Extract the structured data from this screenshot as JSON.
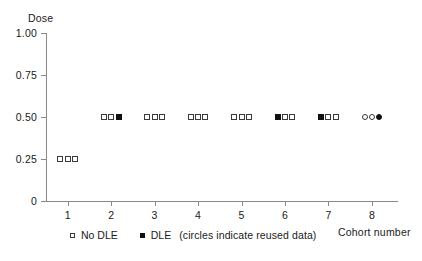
{
  "chart_data": {
    "type": "scatter",
    "title": "",
    "xlabel": "Cohort number",
    "ylabel": "Dose",
    "xlim": [
      0.5,
      8.6
    ],
    "ylim": [
      0,
      1.0
    ],
    "grid": false,
    "legend_position": "below-axes-left",
    "y_ticks": [
      "0",
      "0.25",
      "0.50",
      "0.75",
      "1.00"
    ],
    "y_tick_values": [
      0,
      0.25,
      0.5,
      0.75,
      1.0
    ],
    "x_ticks": [
      "1",
      "2",
      "3",
      "4",
      "5",
      "6",
      "7",
      "8"
    ],
    "x_tick_values": [
      1,
      2,
      3,
      4,
      5,
      6,
      7,
      8
    ],
    "marker_legend": [
      {
        "key": "square-open",
        "label": "No DLE"
      },
      {
        "key": "square-filled",
        "label": "DLE"
      }
    ],
    "legend_note": "(circles indicate reused data)",
    "series": [
      {
        "name": "No DLE",
        "marker": "square-open",
        "points": [
          {
            "x": 0.83,
            "y": 0.25,
            "cohort": 1
          },
          {
            "x": 1.0,
            "y": 0.25,
            "cohort": 1
          },
          {
            "x": 1.17,
            "y": 0.25,
            "cohort": 1
          },
          {
            "x": 1.83,
            "y": 0.5,
            "cohort": 2
          },
          {
            "x": 2.0,
            "y": 0.5,
            "cohort": 2
          },
          {
            "x": 2.83,
            "y": 0.5,
            "cohort": 3
          },
          {
            "x": 3.0,
            "y": 0.5,
            "cohort": 3
          },
          {
            "x": 3.17,
            "y": 0.5,
            "cohort": 3
          },
          {
            "x": 3.83,
            "y": 0.5,
            "cohort": 4
          },
          {
            "x": 4.0,
            "y": 0.5,
            "cohort": 4
          },
          {
            "x": 4.17,
            "y": 0.5,
            "cohort": 4
          },
          {
            "x": 4.83,
            "y": 0.5,
            "cohort": 5
          },
          {
            "x": 5.0,
            "y": 0.5,
            "cohort": 5
          },
          {
            "x": 5.17,
            "y": 0.5,
            "cohort": 5
          },
          {
            "x": 6.0,
            "y": 0.5,
            "cohort": 6
          },
          {
            "x": 6.17,
            "y": 0.5,
            "cohort": 6
          },
          {
            "x": 7.0,
            "y": 0.5,
            "cohort": 7
          },
          {
            "x": 7.17,
            "y": 0.5,
            "cohort": 7
          }
        ]
      },
      {
        "name": "DLE",
        "marker": "square-filled",
        "points": [
          {
            "x": 2.17,
            "y": 0.5,
            "cohort": 2
          },
          {
            "x": 5.83,
            "y": 0.5,
            "cohort": 6
          },
          {
            "x": 6.83,
            "y": 0.5,
            "cohort": 7
          }
        ]
      },
      {
        "name": "No DLE (reused data)",
        "marker": "circle-open",
        "points": [
          {
            "x": 7.83,
            "y": 0.5,
            "cohort": 8
          },
          {
            "x": 8.0,
            "y": 0.5,
            "cohort": 8
          }
        ]
      },
      {
        "name": "DLE (reused data)",
        "marker": "circle-filled",
        "points": [
          {
            "x": 8.17,
            "y": 0.5,
            "cohort": 8
          }
        ]
      }
    ]
  }
}
